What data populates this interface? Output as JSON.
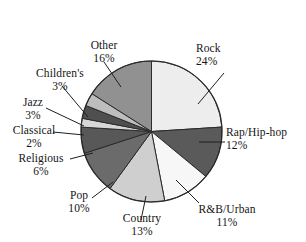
{
  "chart_data": {
    "type": "pie",
    "title": "",
    "subtitle": "",
    "xlabel": "",
    "ylabel": "",
    "legend_position": "none",
    "grid": false,
    "unit": "%",
    "total": 100,
    "categories": [
      "Rock",
      "Rap/Hip-hop",
      "R&B/Urban",
      "Country",
      "Pop",
      "Religious",
      "Classical",
      "Jazz",
      "Children's",
      "Other"
    ],
    "values": [
      24,
      12,
      11,
      13,
      10,
      6,
      2,
      3,
      3,
      16
    ],
    "slices": [
      {
        "label": "Rock",
        "value": 24,
        "value_text": "24%",
        "color": "#ededed"
      },
      {
        "label": "Rap/Hip-hop",
        "value": 12,
        "value_text": "12%",
        "color": "#5a5a5a"
      },
      {
        "label": "R&B/Urban",
        "value": 11,
        "value_text": "11%",
        "color": "#f7f7f7"
      },
      {
        "label": "Country",
        "value": 13,
        "value_text": "13%",
        "color": "#cfcfcf"
      },
      {
        "label": "Pop",
        "value": 10,
        "value_text": "10%",
        "color": "#6b6b6b"
      },
      {
        "label": "Religious",
        "value": 6,
        "value_text": "6%",
        "color": "#585858"
      },
      {
        "label": "Classical",
        "value": 2,
        "value_text": "2%",
        "color": "#d6d6d6"
      },
      {
        "label": "Jazz",
        "value": 3,
        "value_text": "3%",
        "color": "#4f4f4f"
      },
      {
        "label": "Children's",
        "value": 3,
        "value_text": "3%",
        "color": "#bdbdbd"
      },
      {
        "label": "Other",
        "value": 16,
        "value_text": "16%",
        "color": "#919191"
      }
    ],
    "colors": {
      "background": "#ffffff",
      "outline": "#2b2b2b",
      "text": "#141414",
      "leader_line": "#1f1f1f"
    }
  }
}
